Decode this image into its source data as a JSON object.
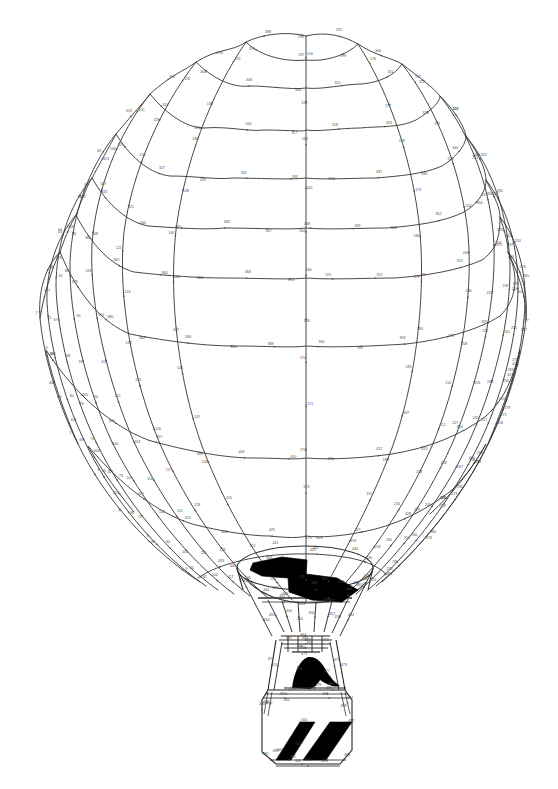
{
  "document": {
    "title": "Hot Air Balloon Connect-the-Dots",
    "subject": "hot-air-balloon",
    "medium": "scanned line drawing",
    "background_color": "#ffffff",
    "line_color": "#333333",
    "fill_color": "#000000",
    "number_color": "#4a4a4a",
    "width": 558,
    "height": 789
  },
  "figure": {
    "envelope": {
      "label": "balloon envelope",
      "gore_count": 14,
      "ring_count": 11,
      "top_y": 30,
      "mouth_y": 600,
      "left_x": 38,
      "right_x": 523,
      "widest_y": 300
    },
    "mouth": {
      "label": "balloon mouth opening",
      "center_x": 305,
      "center_y": 568,
      "rx": 68,
      "ry": 22
    },
    "flame_motif": {
      "label": "black zigzag lightning motif",
      "color": "#000000"
    },
    "burner": {
      "label": "burner and load frame",
      "center_x": 305,
      "top_y": 628,
      "bottom_y": 688
    },
    "basket": {
      "label": "wicker basket",
      "left_x": 262,
      "right_x": 352,
      "top_y": 686,
      "bottom_y": 766,
      "stripe_count": 2,
      "stripe_color": "#000000"
    }
  },
  "dot_numbers": {
    "note": "numbered connect-the-dot labels printed beside each vertex",
    "total_approx": 500,
    "range_min": 1,
    "range_max": 505,
    "samples": [
      "1",
      "2",
      "3",
      "4",
      "5",
      "6",
      "7",
      "8",
      "9",
      "10",
      "24",
      "25",
      "28",
      "30",
      "33",
      "34",
      "36",
      "38",
      "40",
      "62",
      "64",
      "65",
      "67",
      "68",
      "70",
      "71",
      "73",
      "74",
      "80",
      "81",
      "82",
      "84",
      "86",
      "88",
      "90",
      "92",
      "94",
      "100",
      "101",
      "102",
      "103",
      "104",
      "105",
      "106",
      "107",
      "108",
      "109",
      "110",
      "111",
      "112",
      "113",
      "114",
      "115",
      "116",
      "117",
      "118",
      "119",
      "120",
      "121",
      "122",
      "123",
      "124",
      "125",
      "126",
      "127",
      "128",
      "129",
      "130",
      "131",
      "134",
      "136",
      "138",
      "140",
      "142",
      "143",
      "145",
      "147",
      "149",
      "150",
      "152",
      "154",
      "156",
      "158",
      "160",
      "162",
      "164",
      "166",
      "168",
      "170",
      "171",
      "172",
      "173",
      "174",
      "175",
      "176",
      "177",
      "178",
      "179",
      "180",
      "181",
      "183",
      "185",
      "187",
      "189",
      "191",
      "193",
      "195",
      "197",
      "199",
      "200",
      "202",
      "204",
      "206",
      "208",
      "210",
      "212",
      "214",
      "216",
      "218",
      "219",
      "220",
      "221",
      "222",
      "223",
      "224",
      "225",
      "226",
      "227",
      "228",
      "229",
      "230",
      "231",
      "233",
      "235",
      "237",
      "239",
      "241",
      "243",
      "245",
      "247",
      "249",
      "250",
      "251",
      "252",
      "253",
      "254",
      "255",
      "256",
      "257",
      "258",
      "259",
      "260",
      "261",
      "263",
      "265",
      "267",
      "269",
      "271",
      "272",
      "273",
      "274",
      "275",
      "276",
      "277",
      "278",
      "279",
      "280",
      "282",
      "284",
      "286",
      "288",
      "290",
      "291",
      "293",
      "295",
      "297",
      "299",
      "300",
      "302",
      "304",
      "306",
      "308",
      "310",
      "311",
      "312",
      "313",
      "314",
      "315",
      "316",
      "317",
      "318",
      "319",
      "320",
      "321",
      "323",
      "325",
      "327",
      "329",
      "331",
      "333",
      "335",
      "337",
      "339",
      "340",
      "341",
      "342",
      "343",
      "344",
      "345",
      "346",
      "347",
      "348",
      "349",
      "350",
      "352",
      "354",
      "356",
      "358",
      "360",
      "362",
      "364",
      "366",
      "368",
      "370",
      "371",
      "372",
      "373",
      "374",
      "375",
      "376",
      "377",
      "378",
      "379",
      "380",
      "382",
      "384",
      "386",
      "388",
      "390",
      "391",
      "393",
      "395",
      "397",
      "399",
      "400",
      "401",
      "402",
      "403",
      "404",
      "405",
      "406",
      "407",
      "408",
      "409",
      "410",
      "411",
      "412",
      "413",
      "414",
      "415",
      "416",
      "417",
      "418",
      "419",
      "420",
      "421",
      "422",
      "423",
      "424",
      "425",
      "426",
      "427",
      "428",
      "429",
      "430",
      "431",
      "432",
      "433",
      "434",
      "435",
      "436",
      "437",
      "438",
      "439",
      "440",
      "441",
      "442",
      "443",
      "444",
      "445",
      "446",
      "447",
      "448",
      "449",
      "450",
      "451",
      "452",
      "453",
      "454",
      "455",
      "456",
      "457",
      "458",
      "459",
      "460",
      "461",
      "462",
      "463",
      "464",
      "465",
      "466",
      "467",
      "468",
      "469",
      "470",
      "471",
      "472",
      "473",
      "474",
      "475",
      "476",
      "477",
      "478",
      "479",
      "480",
      "481",
      "482",
      "483",
      "484",
      "485",
      "486",
      "487",
      "488",
      "490",
      "491",
      "492",
      "493",
      "494",
      "495",
      "496",
      "497",
      "498",
      "499",
      "500",
      "501",
      "505"
    ]
  }
}
